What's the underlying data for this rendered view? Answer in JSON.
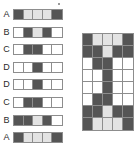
{
  "figure": {
    "caption": "",
    "colors": {
      "dark": "#555555",
      "light": "#e3e3e3",
      "white": "#ffffff",
      "outline": "#8d8d8d",
      "label_text": "#2b2b2b",
      "background": "#ffffff"
    },
    "artifact": {
      "name": "speck",
      "label": ""
    }
  },
  "bar_list": {
    "name": "labelled-bar-list",
    "columns": 5,
    "rows": [
      {
        "label": "A",
        "cells": [
          "dark",
          "light",
          "light",
          "light",
          "dark"
        ],
        "cell_labels": [
          "",
          "",
          "",
          "",
          ""
        ]
      },
      {
        "label": "B",
        "cells": [
          "white",
          "dark",
          "light",
          "dark",
          "white"
        ],
        "cell_labels": [
          "",
          "",
          "",
          "",
          ""
        ]
      },
      {
        "label": "C",
        "cells": [
          "white",
          "dark",
          "dark",
          "white",
          "white"
        ],
        "cell_labels": [
          "",
          "",
          "",
          "",
          ""
        ]
      },
      {
        "label": "D",
        "cells": [
          "white",
          "white",
          "dark",
          "white",
          "white"
        ],
        "cell_labels": [
          "",
          "",
          "",
          "",
          ""
        ]
      },
      {
        "label": "D",
        "cells": [
          "white",
          "white",
          "dark",
          "white",
          "white"
        ],
        "cell_labels": [
          "",
          "",
          "",
          "",
          ""
        ]
      },
      {
        "label": "C",
        "cells": [
          "white",
          "dark",
          "dark",
          "white",
          "white"
        ],
        "cell_labels": [
          "",
          "",
          "",
          "",
          ""
        ]
      },
      {
        "label": "B",
        "cells": [
          "dark",
          "dark",
          "light",
          "dark",
          "white"
        ],
        "cell_labels": [
          "",
          "",
          "",
          "",
          ""
        ]
      },
      {
        "label": "A",
        "cells": [
          "dark",
          "light",
          "light",
          "light",
          "dark"
        ],
        "cell_labels": [
          "",
          "",
          "",
          "",
          ""
        ]
      }
    ]
  },
  "matrix_block": {
    "name": "stacked-matrix",
    "columns": 5,
    "rows": [
      {
        "cells": [
          "dark",
          "light",
          "light",
          "light",
          "dark"
        ]
      },
      {
        "cells": [
          "dark",
          "dark",
          "light",
          "dark",
          "dark"
        ]
      },
      {
        "cells": [
          "white",
          "dark",
          "dark",
          "white",
          "white"
        ]
      },
      {
        "cells": [
          "white",
          "white",
          "dark",
          "white",
          "white"
        ]
      },
      {
        "cells": [
          "white",
          "white",
          "dark",
          "white",
          "white"
        ]
      },
      {
        "cells": [
          "white",
          "dark",
          "dark",
          "white",
          "white"
        ]
      },
      {
        "cells": [
          "dark",
          "dark",
          "light",
          "dark",
          "dark"
        ]
      },
      {
        "cells": [
          "dark",
          "light",
          "light",
          "light",
          "dark"
        ]
      }
    ]
  }
}
